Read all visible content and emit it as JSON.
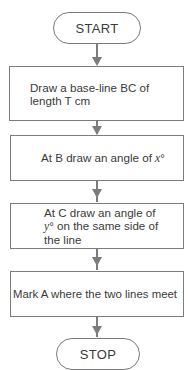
{
  "flowchart": {
    "start_label": "START",
    "stop_label": "STOP",
    "steps": [
      {
        "label": "Draw a base-line BC of length T cm"
      },
      {
        "label_prefix": "At B draw an angle of ",
        "var": "x",
        "label_suffix": "°"
      },
      {
        "label_prefix": "At C draw an angle of ",
        "var": "y",
        "label_suffix": "° on the same side of the line"
      },
      {
        "label": "Mark A where the two lines meet"
      }
    ]
  },
  "colors": {
    "stroke": "#7c7c7c",
    "text": "#3a3a3a",
    "background": "#ffffff"
  }
}
